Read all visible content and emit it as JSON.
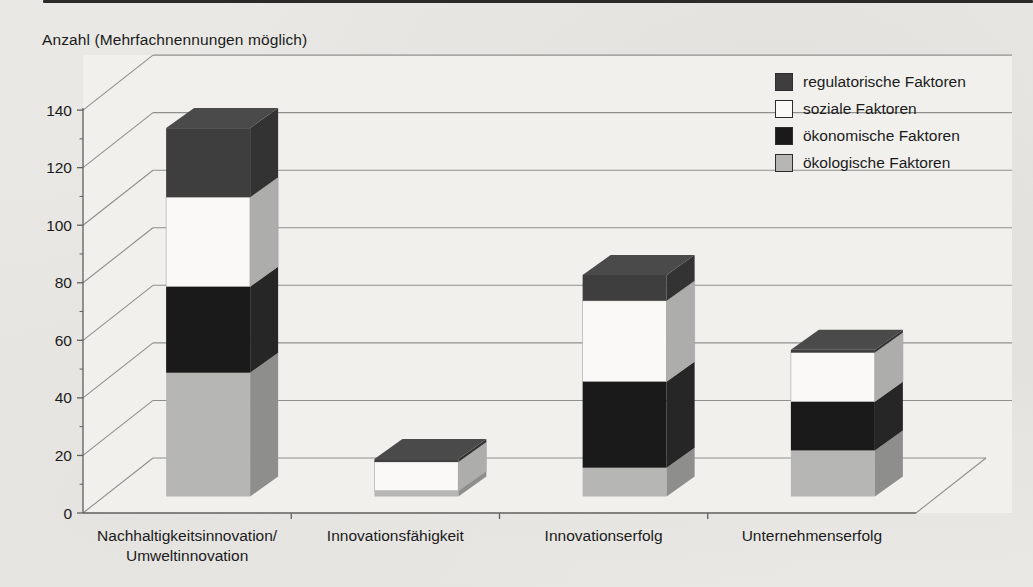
{
  "page": {
    "background_color": "#e9e8e5",
    "top_rule_color": "#2b2a28"
  },
  "chart_data": {
    "type": "bar",
    "subtype": "3d-stacked-column",
    "title": "Anzahl (Mehrfachnennungen möglich)",
    "categories": [
      [
        "Nachhaltigkeitsinnovation/",
        "Umweltinnovation"
      ],
      [
        "Innovationsfähigkeit"
      ],
      [
        "Innovationserfolg"
      ],
      [
        "Unternehmenserfolg"
      ]
    ],
    "series": [
      {
        "name": "ökologische Faktoren",
        "color": "#b6b6b4",
        "side_color": "#8e8e8c",
        "top_color": "#c7c7c5",
        "values": [
          43,
          2,
          10,
          16
        ]
      },
      {
        "name": "ökonomische Faktoren",
        "color": "#1a1a1a",
        "side_color": "#262626",
        "top_color": "#2e2e2e",
        "values": [
          30,
          0,
          30,
          17
        ]
      },
      {
        "name": "soziale Faktoren",
        "color": "#faf9f7",
        "side_color": "#adadab",
        "top_color": "#e6e5e3",
        "values": [
          31,
          10,
          28,
          17
        ]
      },
      {
        "name": "regulatorische Faktoren",
        "color": "#3e3e3e",
        "side_color": "#333333",
        "top_color": "#4a4a4a",
        "values": [
          24,
          1,
          9,
          1
        ]
      }
    ],
    "totals": [
      128,
      13,
      77,
      51
    ],
    "legend": [
      "regulatorische Faktoren",
      "soziale Faktoren",
      "ökonomische Faktoren",
      "ökologische Faktoren"
    ],
    "legend_position": "top-right",
    "ylim": [
      0,
      140
    ],
    "ytick_step": 20,
    "ytick_labels": [
      "0",
      "20",
      "40",
      "60",
      "80",
      "100",
      "120",
      "140"
    ],
    "grid": true,
    "grid_color": "#8f8f8d",
    "axis_color": "#5f5f5d",
    "text_color": "#1b1b1b"
  }
}
